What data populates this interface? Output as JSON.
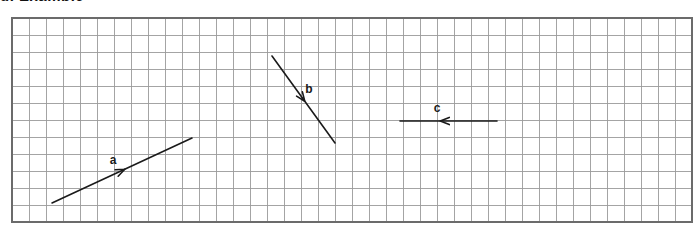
{
  "figure": {
    "caption_remnant": "g. Example",
    "background_color": "#ffffff",
    "grid": {
      "x": 12,
      "y": 18,
      "columns": 40,
      "rows": 12,
      "cell_size": 17,
      "line_color": "#9a9a9a",
      "border_color": "#6b6b6b",
      "line_width": 0.9,
      "border_width": 1.4
    },
    "vector_color": "#1a1a1a",
    "vector_width": 1.6,
    "vectors": [
      {
        "id": "vector-a",
        "label": "a",
        "x1": 52,
        "y1": 203,
        "x2": 192,
        "y2": 138,
        "direction": "up-right",
        "arrow_at": 0.52,
        "label_x": 113,
        "label_y": 164
      },
      {
        "id": "vector-b",
        "label": "b",
        "x1": 272,
        "y1": 56,
        "x2": 335,
        "y2": 143,
        "direction": "down-right",
        "arrow_at": 0.52,
        "label_x": 309,
        "label_y": 93
      },
      {
        "id": "vector-c",
        "label": "c",
        "x1": 497,
        "y1": 121,
        "x2": 400,
        "y2": 121,
        "direction": "left",
        "arrow_at": 0.585,
        "label_x": 437,
        "label_y": 112
      }
    ]
  }
}
